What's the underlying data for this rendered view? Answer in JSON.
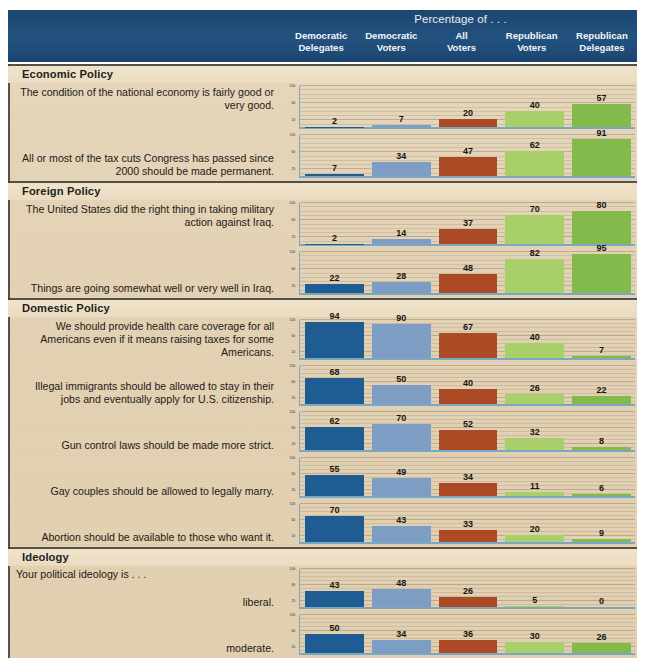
{
  "header": {
    "title": "Percentage of . . .",
    "columns": [
      {
        "line1": "Democratic",
        "line2": "Delegates",
        "color": "#1f5c92"
      },
      {
        "line1": "Democratic",
        "line2": "Voters",
        "color": "#7e9dc4"
      },
      {
        "line1": "All",
        "line2": "Voters",
        "color": "#ac4a25"
      },
      {
        "line1": "Republican",
        "line2": "Voters",
        "color": "#a9cf6b"
      },
      {
        "line1": "Republican",
        "line2": "Delegates",
        "color": "#84b94b"
      }
    ],
    "background_color": "#1e4a75"
  },
  "board": {
    "background_color": "#e3d2b4"
  },
  "axis": {
    "ticks": [
      "100",
      "60",
      "20"
    ],
    "ymax": 100,
    "axis_color": "#79a7c4"
  },
  "sections": [
    {
      "title": "Economic Policy",
      "rows": [
        {
          "label": "The condition of the national economy is fairly good or very good.",
          "align": "top",
          "values": [
            2,
            7,
            20,
            40,
            57
          ]
        },
        {
          "label": "All or most of the tax cuts Congress has passed since 2000 should be made permanent.",
          "align": "bottom",
          "values": [
            7,
            34,
            47,
            62,
            91
          ]
        }
      ]
    },
    {
      "title": "Foreign Policy",
      "rows": [
        {
          "label": "The United States did the right thing in taking military action against Iraq.",
          "align": "top",
          "values": [
            2,
            14,
            37,
            70,
            80
          ]
        },
        {
          "label": "Things are going somewhat well or very well in Iraq.",
          "align": "bottom",
          "values": [
            22,
            28,
            48,
            82,
            95
          ]
        }
      ]
    },
    {
      "title": "Domestic Policy",
      "rows": [
        {
          "label": "We should provide health care coverage for all Americans even if it means raising taxes for some Americans.",
          "align": "top",
          "values": [
            94,
            90,
            67,
            40,
            7
          ]
        },
        {
          "label": "Illegal immigrants should be allowed to stay in their jobs and eventually apply for U.S. citizenship.",
          "align": "bottom",
          "values": [
            68,
            50,
            40,
            26,
            22
          ]
        },
        {
          "label": "Gun control laws should be made more strict.",
          "align": "bottom",
          "values": [
            62,
            70,
            52,
            32,
            8
          ]
        },
        {
          "label": "Gay couples should be allowed to legally marry.",
          "align": "bottom",
          "values": [
            55,
            49,
            34,
            11,
            6
          ]
        },
        {
          "label": "Abortion should be available to those who want it.",
          "align": "bottom",
          "values": [
            70,
            43,
            33,
            20,
            9
          ]
        }
      ]
    },
    {
      "title": "Ideology",
      "intro": "Your political ideology is . . .",
      "rows": [
        {
          "label": "liberal.",
          "align": "bottom",
          "values": [
            43,
            48,
            26,
            5,
            0
          ]
        },
        {
          "label": "moderate.",
          "align": "bottom",
          "values": [
            50,
            34,
            36,
            30,
            26
          ]
        },
        {
          "label": "conservative.",
          "align": "bottom",
          "values": [
            3,
            16,
            36,
            63,
            72
          ]
        }
      ]
    }
  ],
  "chart_data": {
    "type": "bar",
    "title": "Percentage of . . .",
    "xlabel": "",
    "ylabel": "",
    "ylim": [
      0,
      100
    ],
    "grid": true,
    "legend_position": "top-header",
    "categories": [
      "Democratic Delegates",
      "Democratic Voters",
      "All Voters",
      "Republican Voters",
      "Republican Delegates"
    ],
    "panels": [
      {
        "section": "Economic Policy",
        "statement": "The condition of the national economy is fairly good or very good.",
        "values": [
          2,
          7,
          20,
          40,
          57
        ]
      },
      {
        "section": "Economic Policy",
        "statement": "All or most of the tax cuts Congress has passed since 2000 should be made permanent.",
        "values": [
          7,
          34,
          47,
          62,
          91
        ]
      },
      {
        "section": "Foreign Policy",
        "statement": "The United States did the right thing in taking military action against Iraq.",
        "values": [
          2,
          14,
          37,
          70,
          80
        ]
      },
      {
        "section": "Foreign Policy",
        "statement": "Things are going somewhat well or very well in Iraq.",
        "values": [
          22,
          28,
          48,
          82,
          95
        ]
      },
      {
        "section": "Domestic Policy",
        "statement": "We should provide health care coverage for all Americans even if it means raising taxes for some Americans.",
        "values": [
          94,
          90,
          67,
          40,
          7
        ]
      },
      {
        "section": "Domestic Policy",
        "statement": "Illegal immigrants should be allowed to stay in their jobs and eventually apply for U.S. citizenship.",
        "values": [
          68,
          50,
          40,
          26,
          22
        ]
      },
      {
        "section": "Domestic Policy",
        "statement": "Gun control laws should be made more strict.",
        "values": [
          62,
          70,
          52,
          32,
          8
        ]
      },
      {
        "section": "Domestic Policy",
        "statement": "Gay couples should be allowed to legally marry.",
        "values": [
          55,
          49,
          34,
          11,
          6
        ]
      },
      {
        "section": "Domestic Policy",
        "statement": "Abortion should be available to those who want it.",
        "values": [
          70,
          43,
          33,
          20,
          9
        ]
      },
      {
        "section": "Ideology",
        "statement": "Your political ideology is . . . liberal.",
        "values": [
          43,
          48,
          26,
          5,
          0
        ]
      },
      {
        "section": "Ideology",
        "statement": "Your political ideology is . . . moderate.",
        "values": [
          50,
          34,
          36,
          30,
          26
        ]
      },
      {
        "section": "Ideology",
        "statement": "Your political ideology is . . . conservative.",
        "values": [
          3,
          16,
          36,
          63,
          72
        ]
      }
    ]
  }
}
